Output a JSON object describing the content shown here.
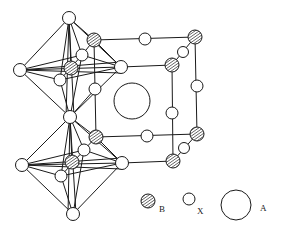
{
  "diagram": {
    "title": "",
    "type": "perovskite crystal structure",
    "legend": [
      {
        "key": "B",
        "label": "B",
        "style": "hatched",
        "meaning": "B-site cation"
      },
      {
        "key": "X",
        "label": "X",
        "style": "open-small",
        "meaning": "anion"
      },
      {
        "key": "A",
        "label": "A",
        "style": "open-large",
        "meaning": "A-site cation"
      }
    ],
    "colors": {
      "ink": "#1a1a1a",
      "background": "#ffffff"
    }
  }
}
